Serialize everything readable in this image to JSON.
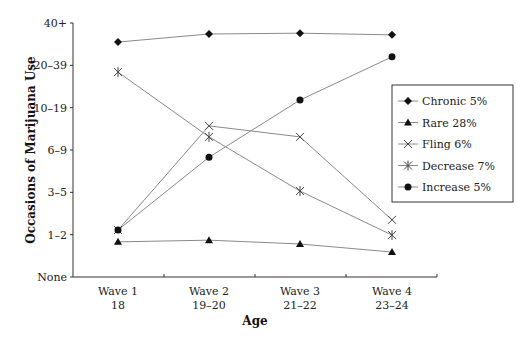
{
  "chart_data": {
    "type": "line",
    "title": "",
    "xlabel": "Age",
    "ylabel": "Occasions of Marijuana Use",
    "categories": [
      {
        "line1": "Wave 1",
        "line2": "18"
      },
      {
        "line1": "Wave 2",
        "line2": "19–20"
      },
      {
        "line1": "Wave 3",
        "line2": "21–22"
      },
      {
        "line1": "Wave 4",
        "line2": "23–24"
      }
    ],
    "y_ticks": [
      "None",
      "1–2",
      "3–5",
      "6–9",
      "10–19",
      "20–39",
      "40+"
    ],
    "ylim": [
      0,
      6
    ],
    "grid": false,
    "legend_position": "right",
    "series": [
      {
        "name": "Chronic 5%",
        "marker": "diamond",
        "values": [
          5.55,
          5.74,
          5.76,
          5.72
        ]
      },
      {
        "name": "Rare 28%",
        "marker": "triangle",
        "values": [
          0.83,
          0.87,
          0.78,
          0.59
        ]
      },
      {
        "name": "Fling 6%",
        "marker": "x",
        "values": [
          1.11,
          3.57,
          3.31,
          1.35
        ]
      },
      {
        "name": "Decrease 7%",
        "marker": "asterisk",
        "values": [
          4.84,
          3.31,
          2.03,
          0.99
        ]
      },
      {
        "name": "Increase 5%",
        "marker": "circle",
        "values": [
          1.11,
          2.83,
          4.18,
          5.2
        ]
      }
    ]
  },
  "colors": {
    "line": "#8a8a8a",
    "marker": "#111111",
    "axis": "#333333"
  }
}
